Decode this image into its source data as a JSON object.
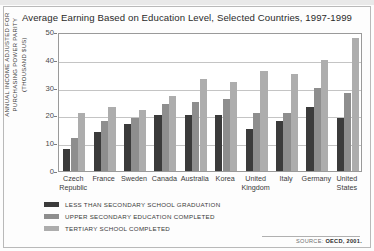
{
  "title": "Average Earning Based on Education Level, Selected Countries, 1997-1999",
  "yaxis_title_lines": [
    "ANNUAL INCOME ADJUSTED FOR",
    "PURCHASING POWER PARITY",
    "(THOUSAND $US)"
  ],
  "source": {
    "label": "SOURCE:",
    "value": "OECD, 2001."
  },
  "legend": [
    {
      "label": "LESS THAN SECONDARY SCHOOL GRADUATION",
      "color": "#3b3b3b"
    },
    {
      "label": "UPPER SECONDARY EDUCATION COMPLETED",
      "color": "#8e8e8e"
    },
    {
      "label": "TERTIARY SCHOOL COMPLETED",
      "color": "#adadad"
    }
  ],
  "chart_data": {
    "type": "bar",
    "title": "Average Earning Based on Education Level, Selected Countries, 1997-1999",
    "xlabel": "",
    "ylabel": "ANNUAL INCOME ADJUSTED FOR PURCHASING POWER PARITY (THOUSAND $US)",
    "ylim": [
      0,
      50
    ],
    "yticks": [
      0,
      10,
      20,
      30,
      40,
      50
    ],
    "grid": true,
    "legend_position": "below-axes-left",
    "categories": [
      "Czech Republic",
      "France",
      "Sweden",
      "Canada",
      "Australia",
      "Korea",
      "United Kingdom",
      "Italy",
      "Germany",
      "United States"
    ],
    "category_lines": [
      [
        "Czech",
        "Republic"
      ],
      [
        "France"
      ],
      [
        "Sweden"
      ],
      [
        "Canada"
      ],
      [
        "Australia"
      ],
      [
        "Korea"
      ],
      [
        "United",
        "Kingdom"
      ],
      [
        "Italy"
      ],
      [
        "Germany"
      ],
      [
        "United",
        "States"
      ]
    ],
    "series": [
      {
        "name": "LESS THAN SECONDARY SCHOOL GRADUATION",
        "color": "#3b3b3b",
        "values": [
          8,
          14,
          17,
          20,
          20,
          20,
          15,
          18,
          23,
          19
        ]
      },
      {
        "name": "UPPER SECONDARY EDUCATION COMPLETED",
        "color": "#8e8e8e",
        "values": [
          12,
          18,
          19,
          24,
          25,
          26,
          21,
          21,
          30,
          28
        ]
      },
      {
        "name": "TERTIARY SCHOOL COMPLETED",
        "color": "#adadad",
        "values": [
          21,
          23,
          22,
          27,
          33,
          32,
          36,
          35,
          40,
          48
        ]
      }
    ]
  }
}
